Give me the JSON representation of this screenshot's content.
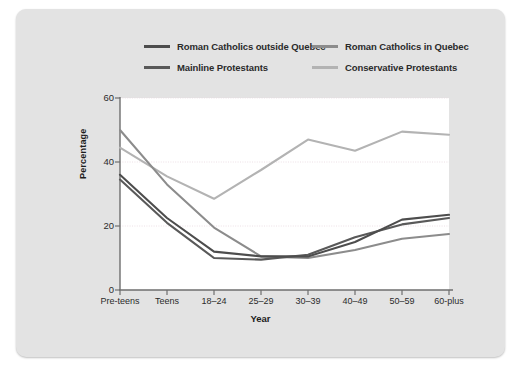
{
  "chart_data": {
    "type": "line",
    "title": "",
    "xlabel": "Year",
    "ylabel": "Percentage",
    "ylim": [
      0,
      60
    ],
    "yticks": [
      0,
      20,
      40,
      60
    ],
    "grid": true,
    "legend_position": "top",
    "categories": [
      "Pre-teens",
      "Teens",
      "18–24",
      "25–29",
      "30–39",
      "40–49",
      "50–59",
      "60-plus"
    ],
    "series": [
      {
        "name": "Roman Catholics outside Quebec",
        "color": "#4d4d4d",
        "values": [
          36.0,
          22.5,
          12.0,
          10.5,
          10.5,
          15.0,
          22.0,
          23.5
        ]
      },
      {
        "name": "Roman Catholics in Quebec",
        "color": "#8c8c8c",
        "values": [
          50.0,
          33.0,
          19.5,
          10.5,
          10.0,
          12.5,
          16.0,
          17.5
        ]
      },
      {
        "name": "Mainline Protestants",
        "color": "#595959",
        "values": [
          34.5,
          21.0,
          10.0,
          9.5,
          11.0,
          16.5,
          20.5,
          22.5
        ]
      },
      {
        "name": "Conservative Protestants",
        "color": "#b3b3b3",
        "values": [
          44.5,
          35.5,
          28.5,
          37.5,
          47.0,
          43.5,
          49.5,
          48.5
        ]
      }
    ]
  },
  "legend": {
    "items": [
      {
        "label": "Roman Catholics outside Quebec",
        "color": "#4d4d4d"
      },
      {
        "label": "Roman Catholics in Quebec",
        "color": "#8c8c8c"
      },
      {
        "label": "Mainline Protestants",
        "color": "#595959"
      },
      {
        "label": "Conservative Protestants",
        "color": "#b3b3b3"
      }
    ]
  },
  "axes": {
    "ytick_labels": [
      "60",
      "40",
      "20",
      "0"
    ],
    "ylabel": "Percentage",
    "xlabel": "Year",
    "xtick_labels": [
      "Pre-teens",
      "Teens",
      "18–24",
      "25–29",
      "30–39",
      "40–49",
      "50–59",
      "60-plus"
    ]
  }
}
